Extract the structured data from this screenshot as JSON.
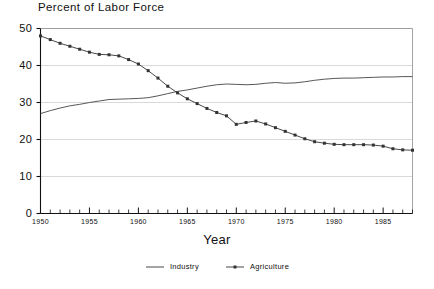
{
  "chart_data": {
    "type": "line",
    "title": "Percent of Labor Force",
    "xlabel": "Year",
    "ylabel": "",
    "xlim": [
      1950,
      1988
    ],
    "ylim": [
      0,
      50
    ],
    "grid": true,
    "legend_position": "bottom-center",
    "yticks": [
      0,
      10,
      20,
      30,
      40,
      50
    ],
    "ytick_labels": [
      "0",
      "10",
      "20",
      "30",
      "40",
      "50"
    ],
    "xticks": [
      1950,
      1955,
      1960,
      1965,
      1970,
      1975,
      1980,
      1985
    ],
    "xtick_labels": [
      "1950",
      "1955",
      "1960",
      "1965",
      "1970",
      "1975",
      "1980",
      "1985"
    ],
    "xtick_minor_step": 1,
    "x": [
      1950,
      1951,
      1952,
      1953,
      1954,
      1955,
      1956,
      1957,
      1958,
      1959,
      1960,
      1961,
      1962,
      1963,
      1964,
      1965,
      1966,
      1967,
      1968,
      1969,
      1970,
      1971,
      1972,
      1973,
      1974,
      1975,
      1976,
      1977,
      1978,
      1979,
      1980,
      1981,
      1982,
      1983,
      1984,
      1985,
      1986,
      1987,
      1988
    ],
    "series": [
      {
        "name": "Industry",
        "marker": "none",
        "color": "#444444",
        "values": [
          27.0,
          27.8,
          28.5,
          29.1,
          29.5,
          30.0,
          30.4,
          30.8,
          30.9,
          31.0,
          31.1,
          31.3,
          31.8,
          32.4,
          33.0,
          33.4,
          33.9,
          34.4,
          34.8,
          35.0,
          34.9,
          34.8,
          34.9,
          35.2,
          35.4,
          35.2,
          35.3,
          35.6,
          36.0,
          36.3,
          36.5,
          36.6,
          36.6,
          36.7,
          36.8,
          36.9,
          36.9,
          37.0,
          37.0
        ]
      },
      {
        "name": "Agriculture",
        "marker": "square",
        "color": "#333333",
        "values": [
          48.0,
          47.0,
          46.0,
          45.2,
          44.4,
          43.6,
          43.0,
          42.9,
          42.6,
          41.6,
          40.4,
          38.6,
          36.6,
          34.4,
          32.6,
          31.0,
          29.7,
          28.4,
          27.3,
          26.4,
          24.1,
          24.6,
          25.0,
          24.2,
          23.2,
          22.2,
          21.2,
          20.2,
          19.4,
          19.0,
          18.7,
          18.6,
          18.6,
          18.6,
          18.5,
          18.2,
          17.5,
          17.2,
          17.1
        ]
      }
    ]
  },
  "legend": {
    "items": [
      {
        "label": "Industry",
        "marker": "line"
      },
      {
        "label": "Agriculture",
        "marker": "line-with-point"
      }
    ]
  }
}
